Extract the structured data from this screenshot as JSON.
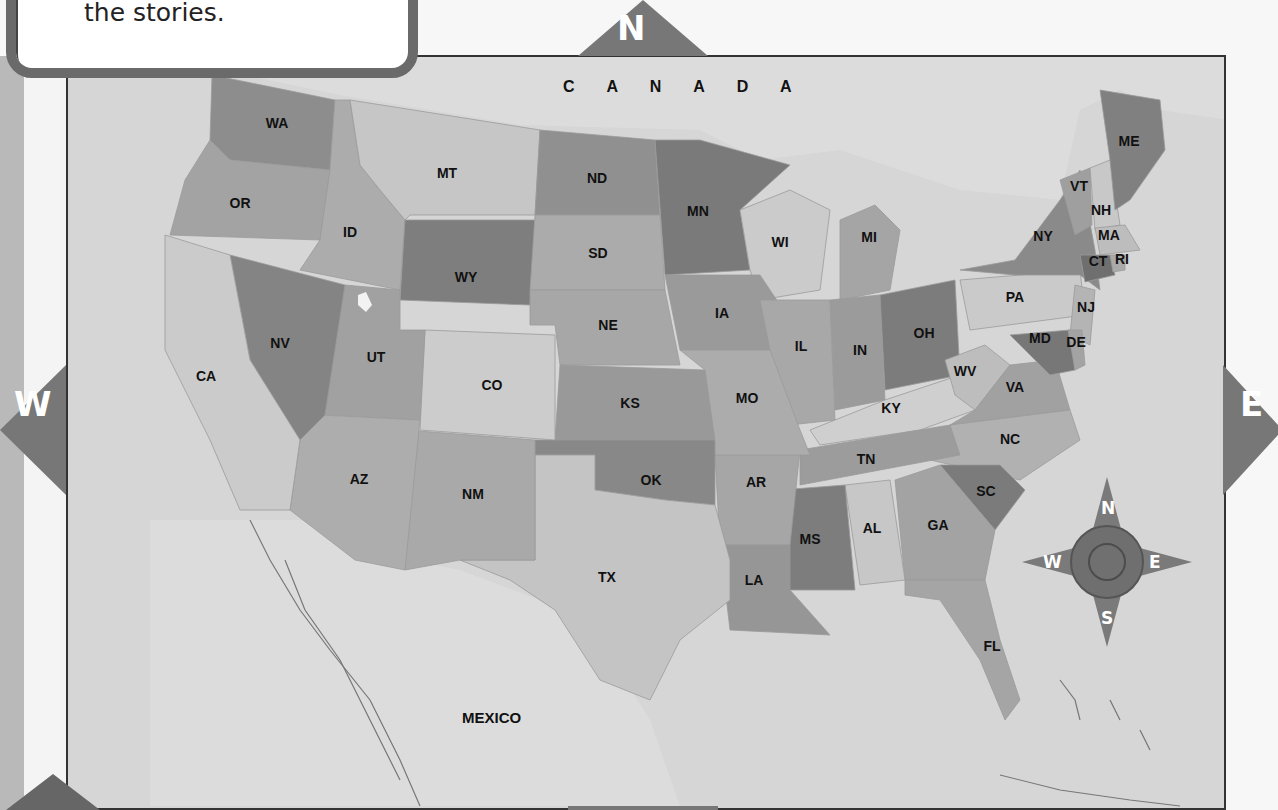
{
  "instruction_box": {
    "text_visible": "the stories."
  },
  "directions": {
    "north": "N",
    "south": "S",
    "east": "E",
    "west": "W"
  },
  "map": {
    "regions": {
      "canada": "C A N A D A",
      "mexico": "MEXICO"
    },
    "states": [
      {
        "abbr": "WA",
        "x": 277,
        "y": 128
      },
      {
        "abbr": "OR",
        "x": 240,
        "y": 208
      },
      {
        "abbr": "ID",
        "x": 350,
        "y": 237
      },
      {
        "abbr": "MT",
        "x": 447,
        "y": 178
      },
      {
        "abbr": "WY",
        "x": 466,
        "y": 282
      },
      {
        "abbr": "ND",
        "x": 597,
        "y": 183
      },
      {
        "abbr": "SD",
        "x": 598,
        "y": 258
      },
      {
        "abbr": "NE",
        "x": 608,
        "y": 330
      },
      {
        "abbr": "MN",
        "x": 698,
        "y": 216
      },
      {
        "abbr": "IA",
        "x": 722,
        "y": 318
      },
      {
        "abbr": "WI",
        "x": 780,
        "y": 247
      },
      {
        "abbr": "MI",
        "x": 869,
        "y": 242
      },
      {
        "abbr": "IL",
        "x": 801,
        "y": 351
      },
      {
        "abbr": "IN",
        "x": 860,
        "y": 355
      },
      {
        "abbr": "OH",
        "x": 924,
        "y": 338
      },
      {
        "abbr": "NY",
        "x": 1043,
        "y": 241
      },
      {
        "abbr": "VT",
        "x": 1079,
        "y": 191
      },
      {
        "abbr": "NH",
        "x": 1101,
        "y": 215
      },
      {
        "abbr": "ME",
        "x": 1129,
        "y": 146
      },
      {
        "abbr": "MA",
        "x": 1109,
        "y": 240
      },
      {
        "abbr": "CT",
        "x": 1098,
        "y": 266
      },
      {
        "abbr": "RI",
        "x": 1122,
        "y": 264
      },
      {
        "abbr": "PA",
        "x": 1015,
        "y": 302
      },
      {
        "abbr": "NJ",
        "x": 1086,
        "y": 312
      },
      {
        "abbr": "MD",
        "x": 1040,
        "y": 343
      },
      {
        "abbr": "DE",
        "x": 1076,
        "y": 347
      },
      {
        "abbr": "WV",
        "x": 965,
        "y": 376
      },
      {
        "abbr": "VA",
        "x": 1015,
        "y": 392
      },
      {
        "abbr": "KY",
        "x": 891,
        "y": 413
      },
      {
        "abbr": "TN",
        "x": 866,
        "y": 464
      },
      {
        "abbr": "NC",
        "x": 1010,
        "y": 444
      },
      {
        "abbr": "SC",
        "x": 986,
        "y": 496
      },
      {
        "abbr": "GA",
        "x": 938,
        "y": 530
      },
      {
        "abbr": "AL",
        "x": 872,
        "y": 533
      },
      {
        "abbr": "MS",
        "x": 810,
        "y": 544
      },
      {
        "abbr": "LA",
        "x": 754,
        "y": 585
      },
      {
        "abbr": "AR",
        "x": 756,
        "y": 487
      },
      {
        "abbr": "MO",
        "x": 747,
        "y": 403
      },
      {
        "abbr": "KS",
        "x": 630,
        "y": 408
      },
      {
        "abbr": "OK",
        "x": 651,
        "y": 485
      },
      {
        "abbr": "TX",
        "x": 607,
        "y": 582
      },
      {
        "abbr": "NM",
        "x": 473,
        "y": 499
      },
      {
        "abbr": "AZ",
        "x": 359,
        "y": 484
      },
      {
        "abbr": "CO",
        "x": 492,
        "y": 390
      },
      {
        "abbr": "UT",
        "x": 376,
        "y": 362
      },
      {
        "abbr": "NV",
        "x": 280,
        "y": 348
      },
      {
        "abbr": "CA",
        "x": 206,
        "y": 381
      },
      {
        "abbr": "FL",
        "x": 992,
        "y": 651
      }
    ],
    "compass_rose": {
      "n": "N",
      "s": "S",
      "e": "E",
      "w": "W"
    }
  },
  "colors": {
    "arrow_fill": "#777777",
    "water": "#d6d6d6",
    "frame": "#333333",
    "box_border": "#6a6a6a"
  }
}
